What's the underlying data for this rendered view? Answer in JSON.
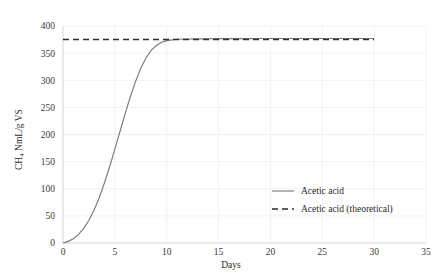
{
  "chart_data": {
    "type": "line",
    "title": "",
    "xlabel": "Days",
    "ylabel": "CH4 NmL/g VS",
    "ylabel_parts": {
      "prefix": "CH",
      "subscript": "4",
      "suffix": " NmL/g VS"
    },
    "xlim": [
      0,
      35
    ],
    "ylim": [
      0,
      400
    ],
    "xticks": [
      0,
      5,
      10,
      15,
      20,
      25,
      30,
      35
    ],
    "xtick_labels": [
      "0",
      "5",
      "10",
      "15",
      "20",
      "25",
      "30",
      "35"
    ],
    "yticks": [
      0,
      50,
      100,
      150,
      200,
      250,
      300,
      350,
      400
    ],
    "ytick_labels": [
      "0",
      "50",
      "100",
      "150",
      "200",
      "250",
      "300",
      "350",
      "400"
    ],
    "grid": true,
    "grid_color": "#eeeeee",
    "legend_position": "right-lower",
    "series": [
      {
        "name": "Acetic acid",
        "style": "solid",
        "color": "#7a7a7a",
        "x": [
          0,
          0.5,
          1,
          1.5,
          2,
          2.5,
          3,
          3.5,
          4,
          4.5,
          5,
          5.5,
          6,
          6.5,
          7,
          7.5,
          8,
          8.5,
          9,
          9.5,
          10,
          11,
          12,
          13,
          14,
          15,
          16,
          17,
          18,
          19,
          20,
          21,
          22,
          23,
          24,
          25,
          26,
          27,
          28,
          29,
          30
        ],
        "values": [
          0,
          3,
          8,
          16,
          27,
          42,
          61,
          84,
          111,
          141,
          173,
          206,
          239,
          270,
          298,
          322,
          341,
          355,
          364,
          370,
          373,
          375.5,
          376,
          376.3,
          376.5,
          376.6,
          376.7,
          376.8,
          376.8,
          376.9,
          376.9,
          376.9,
          377,
          377,
          377,
          377,
          377,
          377,
          377,
          377,
          377
        ]
      },
      {
        "name": "Acetic acid (theoretical)",
        "style": "dashed",
        "color": "#2e2e2e",
        "x": [
          0,
          30
        ],
        "values": [
          375,
          375
        ]
      }
    ]
  },
  "legend": {
    "items": [
      {
        "label": "Acetic acid",
        "style": "solid"
      },
      {
        "label": "Acetic acid (theoretical)",
        "style": "dashed"
      }
    ]
  }
}
